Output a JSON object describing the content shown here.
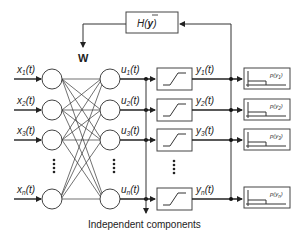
{
  "diagram": {
    "feedback_block": {
      "label_prefix": "H(",
      "label_var": "y",
      "label_suffix": ")"
    },
    "weight_label": "W",
    "inputs": [
      {
        "var": "x",
        "sub": "1",
        "arg": "(t)"
      },
      {
        "var": "x",
        "sub": "2",
        "arg": "(t)"
      },
      {
        "var": "x",
        "sub": "3",
        "arg": "(t)"
      },
      {
        "var": "x",
        "sub": "n",
        "arg": "(t)"
      }
    ],
    "hidden": [
      {
        "var": "u",
        "sub": "1",
        "arg": "(t)"
      },
      {
        "var": "u",
        "sub": "2",
        "arg": "(t)"
      },
      {
        "var": "u",
        "sub": "3",
        "arg": "(t)"
      },
      {
        "var": "u",
        "sub": "n",
        "arg": "(t)"
      }
    ],
    "outputs": [
      {
        "var": "y",
        "sub": "1",
        "arg": "(t)"
      },
      {
        "var": "y",
        "sub": "2",
        "arg": "(t)"
      },
      {
        "var": "y",
        "sub": "3",
        "arg": "(t)"
      },
      {
        "var": "y",
        "sub": "n",
        "arg": "(t)"
      }
    ],
    "pdfs": [
      {
        "label": "p(y",
        "sub": "1",
        "close": ")"
      },
      {
        "label": "p(y",
        "sub": "2",
        "close": ")"
      },
      {
        "label": "p(y",
        "sub": "3",
        "close": ")"
      },
      {
        "label": "p(y",
        "sub": "n",
        "close": ")"
      }
    ],
    "caption": "Independent components"
  }
}
